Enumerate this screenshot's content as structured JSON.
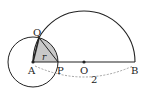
{
  "diagram": {
    "type": "geometry",
    "points": {
      "A": {
        "label": "A"
      },
      "P": {
        "label": "P"
      },
      "O": {
        "label": "O"
      },
      "B": {
        "label": "B"
      },
      "Q": {
        "label": "Q"
      }
    },
    "labels": {
      "radius": "r",
      "length_AB": "2"
    },
    "colors": {
      "stroke": "#222222",
      "shade": "#c8c8c8",
      "dashed": "#999999"
    }
  }
}
